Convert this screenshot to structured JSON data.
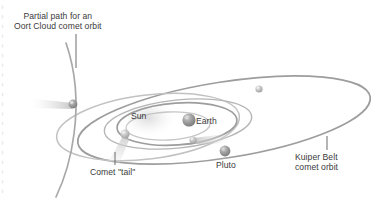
{
  "diagram": {
    "background_color": "#ffffff",
    "orbit_color": "#9a9a9a",
    "label_color": "#3b3b3b",
    "body_color": "#8e8e8e",
    "tail_color": "#d8d8d8"
  },
  "annotations": {
    "oort": {
      "line1": "Partial path for an",
      "line2": "Oort Cloud comet orbit",
      "leader": "vertical"
    },
    "comet_tail": {
      "line1": "Comet \"tail\"",
      "leader": "vertical"
    },
    "kuiper": {
      "line1": "Kuiper Belt",
      "line2": "comet orbit",
      "leader": "vertical"
    }
  },
  "bodies": {
    "sun": {
      "label": "Sun"
    },
    "earth": {
      "label": "Earth"
    },
    "pluto": {
      "label": "Pluto"
    }
  },
  "icons": {
    "sun_glow": "sun-glow-icon",
    "earth_sphere": "earth-sphere-icon",
    "pluto_sphere": "pluto-sphere-icon",
    "comet": "comet-icon",
    "orbit_ellipse": "orbit-ellipse-icon",
    "leader_line": "leader-line-icon"
  }
}
